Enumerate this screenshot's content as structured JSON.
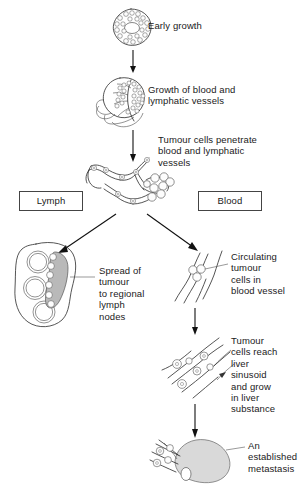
{
  "diagram": {
    "background_color": "#ffffff",
    "ink_color": "#2a2a2a",
    "shade_color": "#b9b9b9",
    "metastasis_fill": "#d9d9d9"
  },
  "labels": {
    "early_growth": "Early growth",
    "vessel_growth": "Growth of blood and\nlymphatic vessels",
    "penetrate": "Tumour cells penetrate\nblood and lymphatic\nvessels",
    "lymph_route": "Lymph",
    "blood_route": "Blood",
    "lymph_node_spread": "Spread of\ntumour\nto regional\nlymph\nnodes",
    "circulating": "Circulating\ntumour\ncells in\nblood vessel",
    "liver_sinusoid": "Tumour\ncells reach\nliver\nsinusoid\nand grow\nin liver\nsubstance",
    "metastasis": "An\nestablished\nmetastasis"
  },
  "stages": [
    {
      "id": "stage-1",
      "name": "early-growth",
      "label_key": "early_growth"
    },
    {
      "id": "stage-2",
      "name": "vessel-growth",
      "label_key": "vessel_growth"
    },
    {
      "id": "stage-3",
      "name": "vessel-penetration",
      "label_key": "penetrate"
    },
    {
      "id": "stage-4a",
      "name": "lymph-node",
      "label_key": "lymph_node_spread"
    },
    {
      "id": "stage-4b",
      "name": "circulating-cells",
      "label_key": "circulating"
    },
    {
      "id": "stage-5b",
      "name": "liver-sinusoid",
      "label_key": "liver_sinusoid"
    },
    {
      "id": "stage-6b",
      "name": "established-metastasis",
      "label_key": "metastasis"
    }
  ],
  "icons": {
    "arrow_down": "down-arrow",
    "arrow_branch_left": "branch-arrow-left",
    "arrow_branch_right": "branch-arrow-right"
  }
}
